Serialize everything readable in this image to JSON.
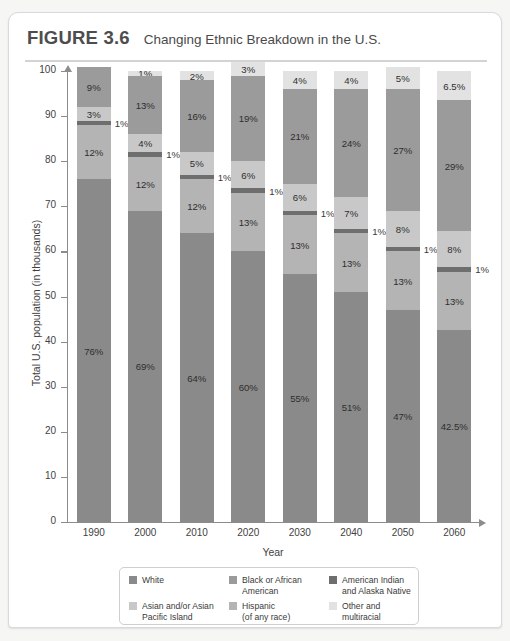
{
  "figure": {
    "number_label": "FIGURE 3.6",
    "title": "Changing Ethnic Breakdown in the U.S."
  },
  "chart_data": {
    "type": "bar",
    "variant": "stacked-vertical",
    "title": "Changing Ethnic Breakdown in the U.S.",
    "xlabel": "Year",
    "ylabel": "Total U.S. population (in thousands)",
    "ylim": [
      0,
      100
    ],
    "ytick_labels": [
      "0",
      "10",
      "20",
      "30",
      "40",
      "50",
      "60",
      "70",
      "80",
      "90",
      "100"
    ],
    "ytick_values": [
      0,
      10,
      20,
      30,
      40,
      50,
      60,
      70,
      80,
      90,
      100
    ],
    "grid": false,
    "legend_position": "bottom",
    "categories": [
      "1990",
      "2000",
      "2010",
      "2020",
      "2030",
      "2040",
      "2050",
      "2060"
    ],
    "stack_order_bottom_to_top": [
      "White",
      "Hispanic",
      "American Indian and Alaska Native",
      "Asian and/or Asian Pacific Island",
      "Black or African American",
      "Other and multiracial"
    ],
    "series": [
      {
        "name": "White",
        "color": "#8a8a8a",
        "values": [
          76,
          69,
          64,
          60,
          55,
          51,
          47,
          42.5
        ],
        "labels": [
          "76%",
          "69%",
          "64%",
          "60%",
          "55%",
          "51%",
          "47%",
          "42.5%"
        ],
        "label_placement": [
          "inside",
          "inside",
          "inside",
          "inside",
          "inside",
          "inside",
          "inside",
          "inside"
        ]
      },
      {
        "name": "Hispanic",
        "color": "#b4b4b4",
        "values": [
          12,
          12,
          12,
          13,
          13,
          13,
          13,
          13
        ],
        "labels": [
          "12%",
          "12%",
          "12%",
          "13%",
          "13%",
          "13%",
          "13%",
          "13%"
        ],
        "label_placement": [
          "inside",
          "inside",
          "inside",
          "inside",
          "inside",
          "inside",
          "inside",
          "inside"
        ]
      },
      {
        "name": "American Indian and Alaska Native",
        "color": "#6e6e6e",
        "values": [
          1,
          1,
          1,
          1,
          1,
          1,
          1,
          1
        ],
        "labels": [
          "1%",
          "1%",
          "1%",
          "1%",
          "1%",
          "1%",
          "1%",
          "1%"
        ],
        "label_placement": [
          "outside",
          "outside",
          "outside",
          "outside",
          "outside",
          "outside",
          "outside",
          "outside"
        ]
      },
      {
        "name": "Asian and/or Asian Pacific Island",
        "color": "#c8c8c8",
        "values": [
          3,
          4,
          5,
          6,
          6,
          7,
          8,
          8
        ],
        "labels": [
          "3%",
          "4%",
          "5%",
          "6%",
          "6%",
          "7%",
          "8%",
          "8%"
        ],
        "label_placement": [
          "inside",
          "inside",
          "inside",
          "inside",
          "inside",
          "inside",
          "inside",
          "inside"
        ]
      },
      {
        "name": "Black or African American",
        "color": "#9b9b9b",
        "values": [
          9,
          13,
          16,
          19,
          21,
          24,
          27,
          29
        ],
        "labels": [
          "9%",
          "13%",
          "16%",
          "19%",
          "21%",
          "24%",
          "27%",
          "29%"
        ],
        "label_placement": [
          "inside",
          "inside",
          "inside",
          "inside",
          "inside",
          "inside",
          "inside",
          "inside"
        ]
      },
      {
        "name": "Other and multiracial",
        "color": "#e2e2e2",
        "values": [
          0,
          1,
          2,
          3,
          4,
          4,
          5,
          6.5
        ],
        "labels": [
          "",
          "1%",
          "2%",
          "3%",
          "4%",
          "4%",
          "5%",
          "6.5%"
        ],
        "label_placement": [
          "inside",
          "inside",
          "inside",
          "inside",
          "inside",
          "inside",
          "inside",
          "inside"
        ]
      }
    ],
    "bar_totals": [
      101,
      100,
      100,
      102,
      100,
      100,
      101,
      100
    ]
  },
  "legend": {
    "items": [
      {
        "label": "White",
        "color": "#8a8a8a"
      },
      {
        "label": "Black or African\nAmerican",
        "color": "#9b9b9b"
      },
      {
        "label": "American Indian\nand Alaska Native",
        "color": "#6e6e6e"
      },
      {
        "label": "Asian and/or Asian\nPacific Island",
        "color": "#c8c8c8"
      },
      {
        "label": "Hispanic\n(of any race)",
        "color": "#b4b4b4"
      },
      {
        "label": "Other and\nmultiracial",
        "color": "#e2e2e2"
      }
    ]
  }
}
